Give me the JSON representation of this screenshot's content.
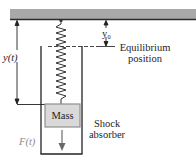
{
  "diagram": {
    "labels": {
      "displacement": "y(t)",
      "equilibrium_offset": "y₀",
      "equilibrium_line": [
        "Equilibrium",
        "position"
      ],
      "mass": "Mass",
      "shock_absorber": [
        "Shock",
        "absorber"
      ],
      "force": "F(t)"
    },
    "colors": {
      "ceiling_fill": "#a9a9a9",
      "ceiling_edge": "#2a2a2a",
      "mass_fill": "#d9d9d9",
      "mass_border": "#8f8f8f",
      "line": "#222222",
      "force_label": "#8a8a8a"
    }
  }
}
